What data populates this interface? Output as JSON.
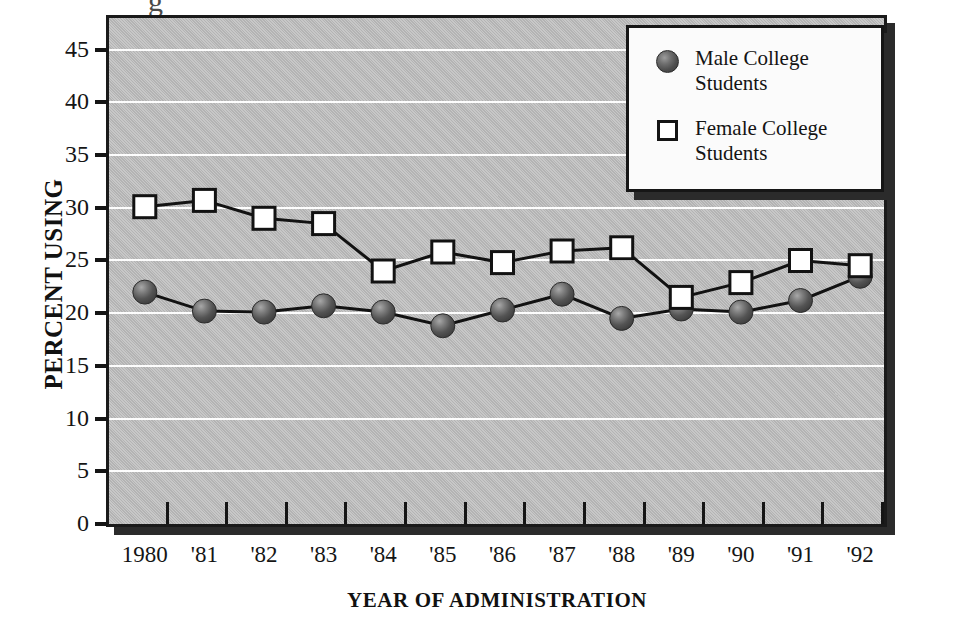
{
  "figure": {
    "top_clipped_glyph": "g",
    "background_color": "#ffffff",
    "plot_background_color": "#bdbdbd",
    "gridline_color": "#fdfdfd",
    "axis_color": "#151515"
  },
  "legend": {
    "position": "top-right-inside",
    "entries": [
      {
        "marker": "filled-sphere-marker",
        "color": "#5a5a5a",
        "line1": "Male College",
        "line2": "Students",
        "label": "Male College Students"
      },
      {
        "marker": "open-square-marker",
        "color": "#ffffff",
        "line1": "Female College",
        "line2": "Students",
        "label": "Female College Students"
      }
    ]
  },
  "chart_data": {
    "type": "line",
    "title": "",
    "subtitle": "",
    "xlabel": "YEAR OF ADMINISTRATION",
    "ylabel": "PERCENT USING",
    "categories": [
      "1980",
      "'81",
      "'82",
      "'83",
      "'84",
      "'85",
      "'86",
      "'87",
      "'88",
      "'89",
      "'90",
      "'91",
      "'92"
    ],
    "x_tick_labels": [
      "1980",
      "'81",
      "'82",
      "'83",
      "'84",
      "'85",
      "'86",
      "'87",
      "'88",
      "'89",
      "'90",
      "'91",
      "'92"
    ],
    "y_tick_labels": [
      "45",
      "40",
      "35",
      "30",
      "25",
      "20",
      "15",
      "10",
      "5",
      "0"
    ],
    "y_ticks": [
      45,
      40,
      35,
      30,
      25,
      20,
      15,
      10,
      5,
      0
    ],
    "ylim": [
      0,
      48
    ],
    "grid": "horizontal",
    "legend_position": "upper right",
    "series": [
      {
        "name": "Male College Students",
        "marker": "sphere",
        "values": [
          22.0,
          20.2,
          20.1,
          20.7,
          20.1,
          18.8,
          20.3,
          21.8,
          19.5,
          20.4,
          20.1,
          21.2,
          23.5
        ]
      },
      {
        "name": "Female College Students",
        "marker": "square",
        "values": [
          30.1,
          30.7,
          29.0,
          28.5,
          24.0,
          25.8,
          24.8,
          25.9,
          26.2,
          21.5,
          22.9,
          25.0,
          24.5
        ]
      }
    ]
  }
}
